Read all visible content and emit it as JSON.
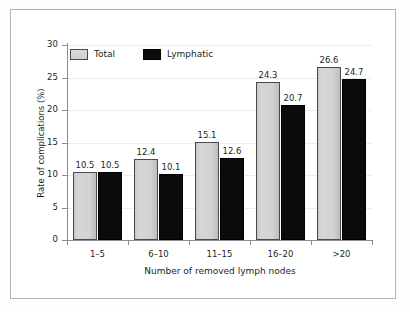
{
  "chart_data": {
    "type": "bar",
    "title": "",
    "xlabel": "Number of removed lymph nodes",
    "ylabel": "Rate of complications (%)",
    "categories": [
      "1–5",
      "6–10",
      "11–15",
      "16–20",
      ">20"
    ],
    "series": [
      {
        "name": "Total",
        "color": "#d2d2d2",
        "values": [
          10.5,
          12.4,
          15.1,
          24.3,
          26.6
        ]
      },
      {
        "name": "Lymphatic",
        "color": "#0b0b0b",
        "values": [
          10.5,
          10.1,
          12.6,
          20.7,
          24.7
        ]
      }
    ],
    "ylim": [
      0,
      30
    ],
    "yticks": [
      0,
      5,
      10,
      15,
      20,
      25,
      30
    ],
    "ytick_labels": [
      "0",
      "5",
      "10",
      "15",
      "20",
      "25",
      "30"
    ],
    "grid": true,
    "legend_position": "top-left",
    "data_labels": [
      "10.5",
      "10.5",
      "12.4",
      "10.1",
      "15.1",
      "12.6",
      "24.3",
      "20.7",
      "26.6",
      "24.7"
    ]
  },
  "legend": {
    "items": [
      {
        "label": "Total"
      },
      {
        "label": "Lymphatic"
      }
    ]
  }
}
